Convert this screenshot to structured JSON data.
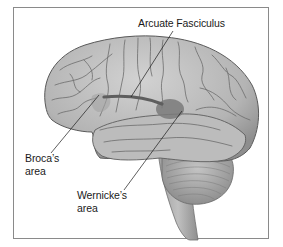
{
  "figure": {
    "colors": {
      "frame_border": "#8a8a8a",
      "brain_fill": "#b8b8b8",
      "sulci": "#6e6e6e",
      "highlight_region": "#7a7a7a",
      "arcuate_band": "#5e5e5e",
      "leader_line": "#1a1a1a"
    }
  },
  "labels": {
    "arcuate": {
      "text": "Arcuate Fasciculus"
    },
    "broca": {
      "line1": "Broca’s",
      "line2": "area"
    },
    "wernicke": {
      "line1": "Wernicke’s",
      "line2": "area"
    }
  }
}
